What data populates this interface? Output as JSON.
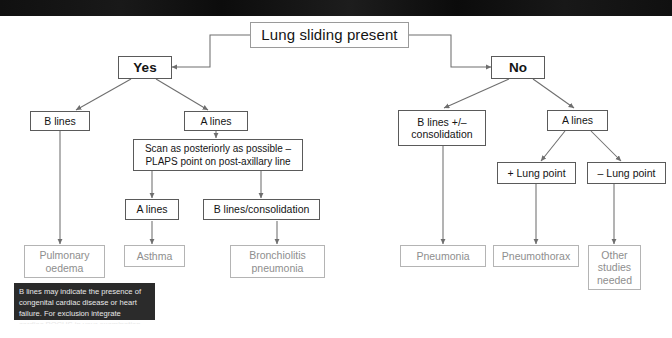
{
  "figure": {
    "title_bar": {
      "present": true,
      "color": "#0d0d0d"
    },
    "type": "flowchart",
    "background": "#ffffff"
  },
  "colors": {
    "node_border": "#5a5a5a",
    "outcome_border": "#b4b4b4",
    "outcome_text": "#8e8e8e",
    "connector": "#6e6e6e",
    "note_bg": "#2b2b2b",
    "note_text": "#e8e8e8",
    "text": "#141414"
  },
  "nodes": {
    "root": "Lung sliding present",
    "yes": "Yes",
    "no": "No",
    "left_b_lines": "B lines",
    "left_a_lines": "A lines",
    "plaps": "Scan as posteriorly as possible –\nPLAPS point on post-axillary line",
    "plaps_a_lines": "A lines",
    "plaps_b_lines_consolidation": "B lines/consolidation",
    "pulmonary_oedema": "Pulmonary\noedema",
    "asthma": "Asthma",
    "bronchiolitis_pneumonia": "Bronchiolitis\npneumonia",
    "right_b_lines_consolidation": "B lines +/–\nconsolidation",
    "right_a_lines": "A lines",
    "plus_lung_point": "+ Lung point",
    "minus_lung_point": "– Lung point",
    "pneumonia": "Pneumonia",
    "pneumothorax": "Pneumothorax",
    "other_studies_needed": "Other\nstudies\nneeded"
  },
  "note": "B lines may indicate the presence of\ncongenital cardiac disease or heart\nfailure. For exclusion integrate\ncardiac POCUS in your examination",
  "edges": [
    {
      "from": "root",
      "to": "yes",
      "style": "elbow-left-arrow"
    },
    {
      "from": "root",
      "to": "no",
      "style": "elbow-right-arrow"
    },
    {
      "from": "yes",
      "to": "left_b_lines",
      "style": "diagonal-arrow"
    },
    {
      "from": "yes",
      "to": "left_a_lines",
      "style": "diagonal-arrow"
    },
    {
      "from": "left_a_lines",
      "to": "plaps",
      "style": "vertical-arrow"
    },
    {
      "from": "plaps",
      "to": "plaps_a_lines",
      "style": "vertical-arrow"
    },
    {
      "from": "plaps",
      "to": "plaps_b_lines_consolidation",
      "style": "vertical-arrow"
    },
    {
      "from": "left_b_lines",
      "to": "pulmonary_oedema",
      "style": "vertical-arrow"
    },
    {
      "from": "plaps_a_lines",
      "to": "asthma",
      "style": "vertical-arrow"
    },
    {
      "from": "plaps_b_lines_consolidation",
      "to": "bronchiolitis_pneumonia",
      "style": "vertical-arrow"
    },
    {
      "from": "no",
      "to": "right_b_lines_consolidation",
      "style": "diagonal-arrow"
    },
    {
      "from": "no",
      "to": "right_a_lines",
      "style": "diagonal-arrow"
    },
    {
      "from": "right_a_lines",
      "to": "plus_lung_point",
      "style": "diagonal-arrow"
    },
    {
      "from": "right_a_lines",
      "to": "minus_lung_point",
      "style": "diagonal-arrow"
    },
    {
      "from": "right_b_lines_consolidation",
      "to": "pneumonia",
      "style": "vertical-arrow"
    },
    {
      "from": "plus_lung_point",
      "to": "pneumothorax",
      "style": "vertical-arrow"
    },
    {
      "from": "minus_lung_point",
      "to": "other_studies_needed",
      "style": "vertical-arrow"
    }
  ]
}
